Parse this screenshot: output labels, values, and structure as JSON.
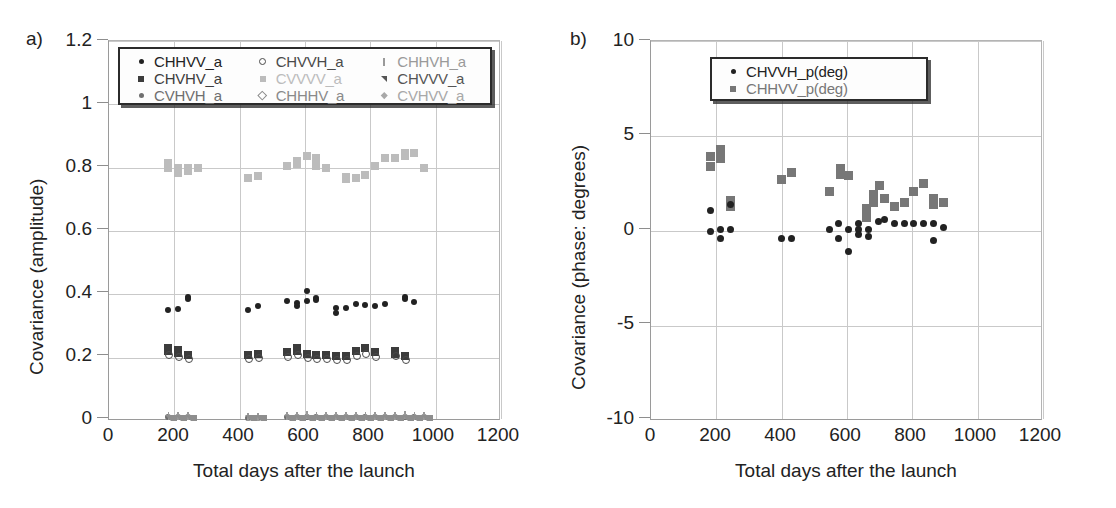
{
  "figure": {
    "panels": [
      "a)",
      "b)"
    ]
  },
  "colors": {
    "black": "#222222",
    "dark_gray": "#4a4a4a",
    "mid_gray": "#767676",
    "light_gray": "#b0b0b0",
    "very_light_gray": "#c8c8c8",
    "grid": "#c9c9c9",
    "axis": "#8e8e8e"
  },
  "panel_a": {
    "tag": "a)",
    "xlabel": "Total days after the launch",
    "ylabel": "Covariance (amplitude)",
    "xticks": [
      "0",
      "200",
      "400",
      "600",
      "800",
      "1000",
      "1200"
    ],
    "yticks": [
      "0",
      "0.2",
      "0.4",
      "0.6",
      "0.8",
      "1",
      "1.2"
    ],
    "legend": {
      "columns": [
        [
          {
            "label": "CHHVV_a",
            "marker": "dot",
            "color": "#222222"
          },
          {
            "label": "CHVHV_a",
            "marker": "square",
            "color": "#3c3c3c"
          },
          {
            "label": "CVHVH_a",
            "marker": "dot",
            "color": "#6f6f6f"
          }
        ],
        [
          {
            "label": "CHVVH_a",
            "marker": "circle-open",
            "color": "#4a4a4a"
          },
          {
            "label": "CVVVV_a",
            "marker": "square",
            "color": "#bcbcbc"
          },
          {
            "label": "CHHHV_a",
            "marker": "diamond-open",
            "color": "#8a8a8a"
          }
        ],
        [
          {
            "label": "CHHVH_a",
            "marker": "bar",
            "color": "#9a9a9a"
          },
          {
            "label": "CHVVV_a",
            "marker": "triangle",
            "color": "#555555"
          },
          {
            "label": "CVHVV_a",
            "marker": "diamond",
            "color": "#a8a8a8"
          }
        ]
      ]
    }
  },
  "panel_b": {
    "tag": "b)",
    "xlabel": "Total days after the launch",
    "ylabel": "Covariance (phase: degrees)",
    "xticks": [
      "0",
      "200",
      "400",
      "600",
      "800",
      "1000",
      "1200"
    ],
    "yticks": [
      "-10",
      "-5",
      "0",
      "5",
      "10"
    ],
    "legend": {
      "columns": [
        [
          {
            "label": "CHVVH_p(deg)",
            "marker": "dot",
            "color": "#222222"
          },
          {
            "label": "CHHVV_p(deg)",
            "marker": "square",
            "color": "#777777"
          }
        ]
      ]
    }
  },
  "chart_data": [
    {
      "type": "scatter",
      "panel": "a",
      "title": "",
      "xlabel": "Total days after the launch",
      "ylabel": "Covariance (amplitude)",
      "xlim": [
        0,
        1200
      ],
      "ylim": [
        0,
        1.2
      ],
      "xticks": [
        0,
        200,
        400,
        600,
        800,
        1000,
        1200
      ],
      "yticks": [
        0,
        0.2,
        0.4,
        0.6,
        0.8,
        1.0,
        1.2
      ],
      "grid": true,
      "legend_position": "top-inside",
      "series": [
        {
          "name": "CVVVV_a",
          "marker": "square",
          "color": "#bcbcbc",
          "points": [
            [
              182,
              0.815
            ],
            [
              182,
              0.8
            ],
            [
              212,
              0.8
            ],
            [
              212,
              0.782
            ],
            [
              242,
              0.798
            ],
            [
              242,
              0.788
            ],
            [
              272,
              0.8
            ],
            [
              425,
              0.768
            ],
            [
              455,
              0.775
            ],
            [
              545,
              0.805
            ],
            [
              575,
              0.82
            ],
            [
              575,
              0.812
            ],
            [
              605,
              0.838
            ],
            [
              635,
              0.83
            ],
            [
              635,
              0.806
            ],
            [
              665,
              0.8
            ],
            [
              725,
              0.772
            ],
            [
              725,
              0.765
            ],
            [
              755,
              0.768
            ],
            [
              785,
              0.778
            ],
            [
              815,
              0.805
            ],
            [
              845,
              0.832
            ],
            [
              875,
              0.83
            ],
            [
              905,
              0.845
            ],
            [
              905,
              0.838
            ],
            [
              935,
              0.845
            ],
            [
              965,
              0.8
            ]
          ]
        },
        {
          "name": "CHHVV_a",
          "marker": "dot",
          "color": "#222222",
          "points": [
            [
              182,
              0.352
            ],
            [
              212,
              0.355
            ],
            [
              242,
              0.392
            ],
            [
              242,
              0.385
            ],
            [
              425,
              0.352
            ],
            [
              455,
              0.362
            ],
            [
              545,
              0.378
            ],
            [
              575,
              0.372
            ],
            [
              575,
              0.362
            ],
            [
              605,
              0.412
            ],
            [
              605,
              0.378
            ],
            [
              635,
              0.388
            ],
            [
              635,
              0.382
            ],
            [
              695,
              0.358
            ],
            [
              695,
              0.342
            ],
            [
              725,
              0.358
            ],
            [
              755,
              0.368
            ],
            [
              785,
              0.365
            ],
            [
              815,
              0.362
            ],
            [
              845,
              0.368
            ],
            [
              905,
              0.392
            ],
            [
              905,
              0.385
            ],
            [
              935,
              0.375
            ]
          ]
        },
        {
          "name": "CHVHV_a",
          "marker": "square",
          "color": "#3c3c3c",
          "points": [
            [
              182,
              0.232
            ],
            [
              182,
              0.222
            ],
            [
              212,
              0.225
            ],
            [
              212,
              0.215
            ],
            [
              242,
              0.208
            ],
            [
              425,
              0.208
            ],
            [
              455,
              0.212
            ],
            [
              545,
              0.218
            ],
            [
              575,
              0.23
            ],
            [
              575,
              0.222
            ],
            [
              605,
              0.212
            ],
            [
              635,
              0.208
            ],
            [
              665,
              0.208
            ],
            [
              695,
              0.205
            ],
            [
              725,
              0.205
            ],
            [
              755,
              0.222
            ],
            [
              785,
              0.232
            ],
            [
              815,
              0.218
            ],
            [
              875,
              0.222
            ],
            [
              875,
              0.212
            ],
            [
              905,
              0.205
            ]
          ]
        },
        {
          "name": "CHVVH_a",
          "marker": "circle-open",
          "color": "#4a4a4a",
          "points": [
            [
              182,
              0.212
            ],
            [
              212,
              0.205
            ],
            [
              242,
              0.198
            ],
            [
              425,
              0.198
            ],
            [
              455,
              0.202
            ],
            [
              545,
              0.205
            ],
            [
              575,
              0.212
            ],
            [
              605,
              0.202
            ],
            [
              635,
              0.198
            ],
            [
              665,
              0.198
            ],
            [
              695,
              0.195
            ],
            [
              725,
              0.195
            ],
            [
              755,
              0.208
            ],
            [
              785,
              0.215
            ],
            [
              815,
              0.205
            ],
            [
              875,
              0.208
            ],
            [
              905,
              0.195
            ]
          ]
        },
        {
          "name": "CVHVH_a",
          "marker": "dot",
          "color": "#6f6f6f",
          "points": [
            [
              182,
              0.012
            ],
            [
              212,
              0.012
            ],
            [
              242,
              0.012
            ],
            [
              425,
              0.01
            ],
            [
              455,
              0.01
            ],
            [
              545,
              0.012
            ],
            [
              575,
              0.012
            ],
            [
              605,
              0.012
            ],
            [
              635,
              0.012
            ],
            [
              665,
              0.012
            ],
            [
              695,
              0.012
            ],
            [
              725,
              0.012
            ],
            [
              755,
              0.012
            ],
            [
              785,
              0.012
            ],
            [
              815,
              0.012
            ],
            [
              845,
              0.012
            ],
            [
              875,
              0.012
            ],
            [
              905,
              0.012
            ],
            [
              935,
              0.012
            ],
            [
              965,
              0.012
            ]
          ]
        },
        {
          "name": "CHHVH_a",
          "marker": "bar",
          "color": "#9a9a9a",
          "points": [
            [
              182,
              0.016
            ],
            [
              212,
              0.016
            ],
            [
              242,
              0.016
            ],
            [
              425,
              0.014
            ],
            [
              455,
              0.014
            ],
            [
              545,
              0.016
            ],
            [
              575,
              0.016
            ],
            [
              605,
              0.018
            ],
            [
              635,
              0.016
            ],
            [
              665,
              0.016
            ],
            [
              695,
              0.016
            ],
            [
              725,
              0.016
            ],
            [
              755,
              0.016
            ],
            [
              785,
              0.016
            ],
            [
              815,
              0.016
            ],
            [
              845,
              0.016
            ],
            [
              875,
              0.016
            ],
            [
              905,
              0.018
            ],
            [
              935,
              0.016
            ],
            [
              965,
              0.016
            ]
          ]
        },
        {
          "name": "CHVVV_a",
          "marker": "triangle",
          "color": "#8e8e8e",
          "points": [
            [
              182,
              0.008
            ],
            [
              212,
              0.008
            ],
            [
              242,
              0.008
            ],
            [
              425,
              0.008
            ],
            [
              455,
              0.008
            ],
            [
              545,
              0.008
            ],
            [
              575,
              0.008
            ],
            [
              605,
              0.008
            ],
            [
              635,
              0.008
            ],
            [
              665,
              0.008
            ],
            [
              695,
              0.008
            ],
            [
              725,
              0.008
            ],
            [
              755,
              0.008
            ],
            [
              785,
              0.008
            ],
            [
              815,
              0.008
            ],
            [
              845,
              0.008
            ],
            [
              875,
              0.008
            ],
            [
              905,
              0.008
            ],
            [
              935,
              0.008
            ],
            [
              965,
              0.008
            ]
          ]
        }
      ]
    },
    {
      "type": "scatter",
      "panel": "b",
      "title": "",
      "xlabel": "Total days after the launch",
      "ylabel": "Covariance (phase: degrees)",
      "xlim": [
        0,
        1200
      ],
      "ylim": [
        -10,
        10
      ],
      "xticks": [
        0,
        200,
        400,
        600,
        800,
        1000,
        1200
      ],
      "yticks": [
        -10,
        -5,
        0,
        5,
        10
      ],
      "grid": true,
      "legend_position": "top-inside",
      "series": [
        {
          "name": "CHHVV_p(deg)",
          "marker": "square",
          "color": "#777777",
          "points": [
            [
              182,
              3.9
            ],
            [
              182,
              3.4
            ],
            [
              212,
              4.3
            ],
            [
              212,
              3.8
            ],
            [
              242,
              1.6
            ],
            [
              242,
              1.3
            ],
            [
              400,
              2.7
            ],
            [
              430,
              3.1
            ],
            [
              545,
              2.1
            ],
            [
              580,
              3.3
            ],
            [
              580,
              3.0
            ],
            [
              605,
              2.9
            ],
            [
              660,
              1.2
            ],
            [
              660,
              0.7
            ],
            [
              680,
              1.9
            ],
            [
              680,
              1.5
            ],
            [
              700,
              2.4
            ],
            [
              715,
              1.7
            ],
            [
              745,
              1.3
            ],
            [
              775,
              1.5
            ],
            [
              805,
              2.1
            ],
            [
              835,
              2.5
            ],
            [
              865,
              1.7
            ],
            [
              865,
              1.4
            ],
            [
              895,
              1.5
            ]
          ]
        },
        {
          "name": "CHVVH_p(deg)",
          "marker": "dot",
          "color": "#222222",
          "points": [
            [
              182,
              1.1
            ],
            [
              182,
              0.0
            ],
            [
              212,
              0.1
            ],
            [
              212,
              -0.4
            ],
            [
              242,
              1.4
            ],
            [
              242,
              0.1
            ],
            [
              400,
              -0.4
            ],
            [
              430,
              -0.4
            ],
            [
              545,
              0.1
            ],
            [
              575,
              0.4
            ],
            [
              575,
              -0.4
            ],
            [
              605,
              0.1
            ],
            [
              605,
              -1.1
            ],
            [
              635,
              0.4
            ],
            [
              635,
              0.1
            ],
            [
              635,
              -0.2
            ],
            [
              665,
              0.1
            ],
            [
              665,
              -0.3
            ],
            [
              695,
              0.5
            ],
            [
              715,
              0.6
            ],
            [
              745,
              0.4
            ],
            [
              775,
              0.4
            ],
            [
              805,
              0.4
            ],
            [
              835,
              0.4
            ],
            [
              865,
              0.4
            ],
            [
              865,
              -0.5
            ],
            [
              895,
              0.2
            ]
          ]
        }
      ]
    }
  ]
}
